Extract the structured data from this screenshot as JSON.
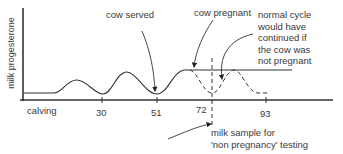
{
  "diagram": {
    "y_axis_label": "milk progesterone",
    "x_axis": {
      "start_label": "calving",
      "ticks": [
        "30",
        "51",
        "72",
        "93"
      ]
    },
    "annotations": {
      "cow_served": "cow served",
      "cow_pregnant": "cow pregnant",
      "normal_cycle": [
        "normal cycle",
        "would have",
        "continued if",
        "the cow was",
        "not pregnant"
      ],
      "milk_sample": [
        "milk sample for",
        "'non pregnancy' testing"
      ]
    },
    "series": {
      "actual": "solid line: progesterone rises and stays high after conception",
      "hypothetical": "dashed line: normal cycle continuing if not pregnant"
    },
    "colors": {
      "line": "#333333",
      "text": "#3a3a3a"
    }
  }
}
